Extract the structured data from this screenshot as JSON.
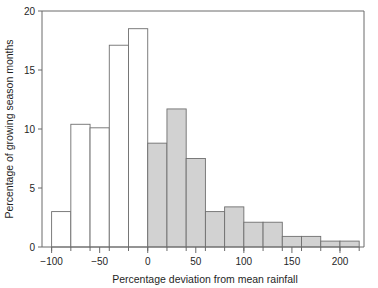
{
  "chart_data": {
    "type": "bar",
    "title": "",
    "subtitle": "",
    "xlabel": "Percentage deviation from mean rainfall",
    "ylabel": "Percentage of growing season months",
    "xlim": [
      -110,
      225
    ],
    "ylim": [
      0,
      20
    ],
    "bin_width": 20,
    "grid": false,
    "legend": null,
    "x_tick_labels": [
      "−100",
      "−50",
      "0",
      "50",
      "100",
      "150",
      "200"
    ],
    "x_tick_values": [
      -100,
      -50,
      0,
      50,
      100,
      150,
      200
    ],
    "x_minor_tick_values": [
      -100,
      -80,
      -60,
      -40,
      -20,
      0,
      20,
      40,
      60,
      80,
      100,
      120,
      140,
      160,
      180,
      200,
      220
    ],
    "y_tick_labels": [
      "0",
      "5",
      "10",
      "15",
      "20"
    ],
    "y_tick_values": [
      0,
      5,
      10,
      15,
      20
    ],
    "categories": [
      "-100 to -80",
      "-80 to -60",
      "-60 to -40",
      "-40 to -20",
      "-20 to 0",
      "0 to 20",
      "20 to 40",
      "40 to 60",
      "60 to 80",
      "80 to 100",
      "100 to 120",
      "120 to 140",
      "140 to 160",
      "160 to 180",
      "180 to 200",
      "200 to 220"
    ],
    "bins": [
      {
        "x0": -100,
        "x1": -80,
        "value": 3.0,
        "fill": "open"
      },
      {
        "x0": -80,
        "x1": -60,
        "value": 10.4,
        "fill": "open"
      },
      {
        "x0": -60,
        "x1": -40,
        "value": 10.1,
        "fill": "open"
      },
      {
        "x0": -40,
        "x1": -20,
        "value": 17.1,
        "fill": "open"
      },
      {
        "x0": -20,
        "x1": 0,
        "value": 18.5,
        "fill": "open"
      },
      {
        "x0": 0,
        "x1": 20,
        "value": 8.8,
        "fill": "filled"
      },
      {
        "x0": 20,
        "x1": 40,
        "value": 11.7,
        "fill": "filled"
      },
      {
        "x0": 40,
        "x1": 60,
        "value": 7.5,
        "fill": "filled"
      },
      {
        "x0": 60,
        "x1": 80,
        "value": 3.0,
        "fill": "filled"
      },
      {
        "x0": 80,
        "x1": 100,
        "value": 3.4,
        "fill": "filled"
      },
      {
        "x0": 100,
        "x1": 120,
        "value": 2.1,
        "fill": "filled"
      },
      {
        "x0": 120,
        "x1": 140,
        "value": 2.1,
        "fill": "filled"
      },
      {
        "x0": 140,
        "x1": 160,
        "value": 0.9,
        "fill": "filled"
      },
      {
        "x0": 160,
        "x1": 180,
        "value": 0.9,
        "fill": "filled"
      },
      {
        "x0": 180,
        "x1": 200,
        "value": 0.5,
        "fill": "filled"
      },
      {
        "x0": 200,
        "x1": 220,
        "value": 0.5,
        "fill": "filled"
      }
    ],
    "colors": {
      "open_fill": "#ffffff",
      "filled_fill": "#d2d2d2",
      "stroke": "#6f6f6f",
      "axis": "#6b6b6b",
      "text": "#1f1f1f"
    }
  }
}
